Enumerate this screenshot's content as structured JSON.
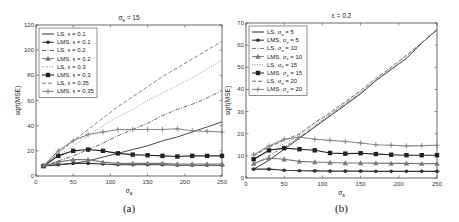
{
  "chart_data": [
    {
      "type": "line",
      "panel_caption": "(a)",
      "title": "σ_e = 15",
      "xlabel": "σ_a",
      "ylabel": "sqrt(MSE)",
      "xlim": [
        0,
        250
      ],
      "ylim": [
        0,
        120
      ],
      "xticks": [
        0,
        50,
        100,
        150,
        200,
        250
      ],
      "yticks": [
        0,
        20,
        40,
        60,
        80,
        100,
        120
      ],
      "legend_position": "upper left",
      "x": [
        10,
        30,
        50,
        70,
        90,
        110,
        130,
        150,
        170,
        190,
        210,
        230,
        250
      ],
      "series": [
        {
          "name": "LS,   ε = 0.1",
          "style": "solid",
          "color": "#333333",
          "marker": "none",
          "values": [
            8,
            9,
            10,
            12,
            15,
            18,
            21,
            24,
            28,
            31,
            35,
            39,
            43
          ]
        },
        {
          "name": "LMS, ε = 0.1",
          "style": "solid",
          "color": "#333333",
          "marker": "star",
          "values": [
            8,
            9,
            10,
            10,
            9.5,
            9,
            9,
            9,
            9,
            8.5,
            8.5,
            8.5,
            8.5
          ]
        },
        {
          "name": "LS,   ε = 0.2",
          "style": "dashdot",
          "color": "#555555",
          "marker": "none",
          "values": [
            8,
            12,
            16,
            21,
            26,
            32,
            37,
            42,
            48,
            53,
            57,
            62,
            68
          ]
        },
        {
          "name": "LMS, ε = 0.2",
          "style": "solid",
          "color": "#777777",
          "marker": "triangle",
          "values": [
            8,
            11,
            13,
            13,
            11,
            10,
            10,
            10,
            10,
            9.5,
            9.5,
            9.5,
            9.5
          ]
        },
        {
          "name": "LS,   ε = 0.3",
          "style": "dotted",
          "color": "#888888",
          "marker": "none",
          "values": [
            8,
            16,
            24,
            32,
            40,
            47,
            53,
            60,
            66,
            72,
            78,
            85,
            92
          ]
        },
        {
          "name": "LMS, ε = 0.3",
          "style": "solid",
          "color": "#222222",
          "marker": "square",
          "values": [
            8,
            16,
            20,
            21,
            20,
            18,
            17,
            16.5,
            16,
            15.5,
            16,
            16,
            16
          ]
        },
        {
          "name": "LS,   ε = 0.35",
          "style": "dashed",
          "color": "#777777",
          "marker": "none",
          "values": [
            8,
            18,
            28,
            37,
            46,
            55,
            63,
            71,
            79,
            86,
            93,
            100,
            107
          ]
        },
        {
          "name": "LMS, ε = 0.35",
          "style": "solid",
          "color": "#888888",
          "marker": "plus",
          "values": [
            8,
            20,
            28,
            33,
            35,
            37,
            37,
            37,
            37,
            37.5,
            36,
            35.5,
            35
          ]
        }
      ]
    },
    {
      "type": "line",
      "panel_caption": "(b)",
      "title": "ε = 0.2",
      "xlabel": "σ_a",
      "ylabel": "sqrt(MSE)",
      "xlim": [
        0,
        250
      ],
      "ylim": [
        0,
        70
      ],
      "xticks": [
        0,
        50,
        100,
        150,
        200,
        250
      ],
      "yticks": [
        0,
        10,
        20,
        30,
        40,
        50,
        60,
        70
      ],
      "legend_position": "upper left",
      "x": [
        10,
        30,
        50,
        70,
        90,
        110,
        130,
        150,
        170,
        190,
        210,
        230,
        250
      ],
      "series": [
        {
          "name": "LS,   σ_e = 5",
          "style": "solid",
          "color": "#222222",
          "marker": "none",
          "values": [
            4,
            8,
            13,
            18,
            23,
            28,
            33,
            38,
            44,
            49,
            54,
            61,
            67
          ]
        },
        {
          "name": "LMS, σ_e = 5",
          "style": "solid",
          "color": "#333333",
          "marker": "star",
          "values": [
            4,
            4,
            3.5,
            3.3,
            3.2,
            3.1,
            3.1,
            3.1,
            3.0,
            3.0,
            3.0,
            3.0,
            3.0
          ]
        },
        {
          "name": "LS,   σ_e = 10",
          "style": "dashdot",
          "color": "#777777",
          "marker": "none",
          "values": [
            6,
            10,
            14,
            18.5,
            23.5,
            28.5,
            33.5,
            38.5,
            44,
            49,
            54,
            61,
            67
          ]
        },
        {
          "name": "LMS, σ_e = 10",
          "style": "solid",
          "color": "#777777",
          "marker": "triangle",
          "values": [
            6.5,
            9,
            8.5,
            7.5,
            7.2,
            7.0,
            6.8,
            6.8,
            6.7,
            6.6,
            6.6,
            6.5,
            6.5
          ]
        },
        {
          "name": "LS,   σ_e = 15",
          "style": "dotted",
          "color": "#888888",
          "marker": "none",
          "values": [
            8,
            12,
            15.5,
            19.5,
            24.5,
            29,
            34,
            39,
            44.5,
            49.5,
            55,
            61,
            67
          ]
        },
        {
          "name": "LMS, σ_e = 15",
          "style": "solid",
          "color": "#222222",
          "marker": "square",
          "values": [
            8.5,
            12.5,
            13.5,
            13,
            12.5,
            11.3,
            11,
            11.2,
            10.8,
            10.5,
            10.3,
            10.3,
            10.3
          ]
        },
        {
          "name": "LS,   σ_e = 20",
          "style": "dashed",
          "color": "#666666",
          "marker": "none",
          "values": [
            10,
            14,
            17,
            20,
            25,
            29.5,
            34.5,
            39.5,
            45,
            50,
            55.5,
            61,
            67
          ]
        },
        {
          "name": "LMS, σ_e = 20",
          "style": "solid",
          "color": "#888888",
          "marker": "plus",
          "values": [
            10.5,
            14.5,
            17.5,
            18.5,
            17.5,
            17,
            16.5,
            15.8,
            15,
            14.8,
            14.5,
            14.6,
            14.8
          ]
        }
      ]
    }
  ],
  "panels": {
    "a": {
      "title": "σ",
      "title_sub": "e",
      "title_rest": " = 15",
      "xlabel": "σ",
      "xlabel_sub": "a",
      "ylabel": "sqrt(MSE)",
      "caption": "(a)"
    },
    "b": {
      "title": "ε = 0.2",
      "xlabel": "σ",
      "xlabel_sub": "a",
      "ylabel": "sqrt(MSE)",
      "caption": "(b)"
    }
  }
}
